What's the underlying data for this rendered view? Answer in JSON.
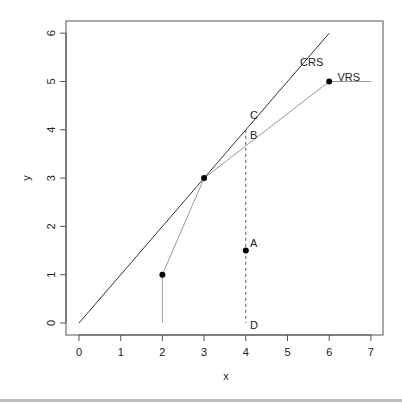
{
  "chart_data": {
    "type": "line",
    "title": "",
    "xlabel": "x",
    "ylabel": "y",
    "xlim": [
      0,
      7
    ],
    "ylim": [
      0,
      6
    ],
    "x_ticks": [
      "0",
      "1",
      "2",
      "3",
      "4",
      "5",
      "6",
      "7"
    ],
    "y_ticks": [
      "0",
      "1",
      "2",
      "3",
      "4",
      "5",
      "6"
    ],
    "grid": false,
    "legend": null,
    "series": [
      {
        "name": "CRS",
        "kind": "line",
        "color": "#333333",
        "points": [
          [
            0,
            0
          ],
          [
            6,
            6
          ]
        ]
      },
      {
        "name": "VRS",
        "kind": "line",
        "color": "#9a9a9a",
        "points": [
          [
            2,
            0
          ],
          [
            2,
            1
          ],
          [
            3,
            3
          ],
          [
            6,
            5
          ],
          [
            7,
            5
          ]
        ]
      },
      {
        "name": "projection",
        "kind": "dashed",
        "color": "#555555",
        "points": [
          [
            4,
            4
          ],
          [
            4,
            0
          ]
        ]
      },
      {
        "name": "DMUs",
        "kind": "scatter",
        "color": "#000000",
        "points": [
          [
            2,
            1
          ],
          [
            3,
            3
          ],
          [
            4,
            1.5
          ],
          [
            6,
            5
          ]
        ]
      }
    ],
    "annotations": [
      {
        "text": "CRS",
        "x": 5.3,
        "y": 5.4
      },
      {
        "text": "VRS",
        "x": 6.2,
        "y": 5.1
      },
      {
        "text": "C",
        "x": 4.1,
        "y": 4.3
      },
      {
        "text": "B",
        "x": 4.1,
        "y": 3.9
      },
      {
        "text": "A",
        "x": 4.1,
        "y": 1.65
      },
      {
        "text": "D",
        "x": 4.1,
        "y": -0.05
      }
    ]
  }
}
